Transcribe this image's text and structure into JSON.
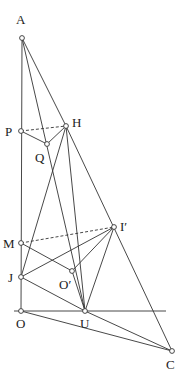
{
  "diagram": {
    "type": "geometry-figure",
    "points": {
      "A": {
        "label": "A",
        "x": 22,
        "y": 38,
        "lx": 16,
        "ly": 24
      },
      "P": {
        "label": "P",
        "x": 21,
        "y": 131,
        "lx": 5,
        "ly": 136
      },
      "H": {
        "label": "H",
        "x": 66,
        "y": 126,
        "lx": 72,
        "ly": 127
      },
      "Q": {
        "label": "Q",
        "x": 47,
        "y": 144,
        "lx": 35,
        "ly": 162
      },
      "M": {
        "label": "M",
        "x": 21,
        "y": 243,
        "lx": 3,
        "ly": 248
      },
      "I_prime": {
        "label": "I′",
        "x": 114,
        "y": 227,
        "lx": 120,
        "ly": 231
      },
      "J": {
        "label": "J",
        "x": 21,
        "y": 277,
        "lx": 8,
        "ly": 282
      },
      "O_prime": {
        "label": "O′",
        "x": 72,
        "y": 271,
        "lx": 59,
        "ly": 289
      },
      "O": {
        "label": "O",
        "x": 21,
        "y": 311,
        "lx": 16,
        "ly": 328
      },
      "U": {
        "label": "U",
        "x": 85,
        "y": 311,
        "lx": 80,
        "ly": 328
      },
      "C": {
        "label": "C",
        "x": 172,
        "y": 351,
        "lx": 166,
        "ly": 369
      }
    },
    "segments": [
      {
        "from": "A",
        "to": "O",
        "style": "solid"
      },
      {
        "from": "A",
        "to": "H",
        "style": "solid"
      },
      {
        "from": "A",
        "to": "U",
        "style": "solid",
        "via": "Q"
      },
      {
        "from": "P",
        "to": "Q",
        "style": "solid"
      },
      {
        "from": "Q",
        "to": "H",
        "style": "solid"
      },
      {
        "from": "P",
        "to": "H",
        "style": "dashed"
      },
      {
        "from": "H",
        "to": "J",
        "style": "solid"
      },
      {
        "from": "H",
        "to": "U",
        "style": "solid"
      },
      {
        "from": "H",
        "to": "C",
        "style": "solid",
        "via": "I_prime"
      },
      {
        "from": "M",
        "to": "I_prime",
        "style": "dashed"
      },
      {
        "from": "M",
        "to": "O_prime",
        "style": "solid"
      },
      {
        "from": "J",
        "to": "I_prime",
        "style": "solid"
      },
      {
        "from": "J",
        "to": "U",
        "style": "solid"
      },
      {
        "from": "O_prime",
        "to": "I_prime",
        "style": "solid"
      },
      {
        "from": "O_prime",
        "to": "U",
        "style": "solid"
      },
      {
        "from": "I_prime",
        "to": "U",
        "style": "solid"
      },
      {
        "from": "O",
        "to": "C",
        "style": "solid"
      },
      {
        "from": "U",
        "to": "C",
        "style": "solid"
      }
    ],
    "baseline": {
      "x1": 14,
      "x2": 166,
      "y": 311
    }
  }
}
